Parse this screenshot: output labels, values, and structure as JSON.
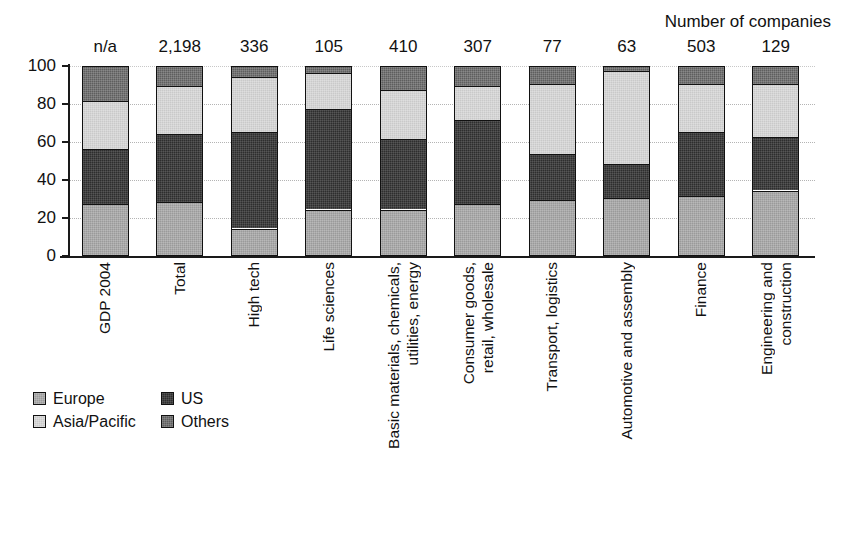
{
  "annotation": "Number of companies",
  "legend": {
    "position": "bottom-left",
    "entries": [
      {
        "label": "Europe",
        "color": "#9a9a9a"
      },
      {
        "label": "US",
        "color": "#2e2e2e"
      },
      {
        "label": "Asia/Pacific",
        "color": "#c9c9c9"
      },
      {
        "label": "Others",
        "color": "#5e5e5e"
      }
    ]
  },
  "axis": {
    "y_ticks": [
      "0",
      "20",
      "40",
      "60",
      "80",
      "100"
    ],
    "y_min": 0,
    "y_max": 100
  },
  "chart_data": {
    "type": "bar",
    "subtype": "stacked-percentage",
    "title": "",
    "xlabel": "",
    "ylabel": "",
    "ylim": [
      0,
      100
    ],
    "grid": true,
    "legend_position": "bottom-left",
    "annotation": "Number of companies",
    "categories": [
      "GDP 2004",
      "Total",
      "High tech",
      "Life sciences",
      "Basic materials, chemicals, utilities, energy",
      "Consumer goods, retail, wholesale",
      "Transport, logistics",
      "Automotive and assembly",
      "Finance",
      "Engineering and construction"
    ],
    "category_label_lines": [
      [
        "GDP 2004"
      ],
      [
        "Total"
      ],
      [
        "High tech"
      ],
      [
        "Life sciences"
      ],
      [
        "Basic materials, chemicals,",
        "utilities, energy"
      ],
      [
        "Consumer goods,",
        "retail, wholesale"
      ],
      [
        "Transport, logistics"
      ],
      [
        "Automotive and assembly"
      ],
      [
        "Finance"
      ],
      [
        "Engineering and",
        "construction"
      ]
    ],
    "value_labels": [
      "n/a",
      "2,198",
      "336",
      "105",
      "410",
      "307",
      "77",
      "63",
      "503",
      "129"
    ],
    "value_labels_header": "Number of companies",
    "series": [
      {
        "name": "Europe",
        "color": "#9a9a9a",
        "values": [
          28,
          29,
          15,
          25,
          25,
          28,
          30,
          31,
          32,
          35
        ]
      },
      {
        "name": "US",
        "color": "#2e2e2e",
        "values": [
          29,
          36,
          51,
          53,
          37,
          44,
          24,
          18,
          34,
          28
        ]
      },
      {
        "name": "Asia/Pacific",
        "color": "#c9c9c9",
        "values": [
          25,
          25,
          29,
          19,
          26,
          18,
          37,
          49,
          25,
          28
        ]
      },
      {
        "name": "Others",
        "color": "#5e5e5e",
        "values": [
          18,
          10,
          5,
          3,
          12,
          10,
          9,
          2,
          9,
          9
        ]
      }
    ]
  }
}
